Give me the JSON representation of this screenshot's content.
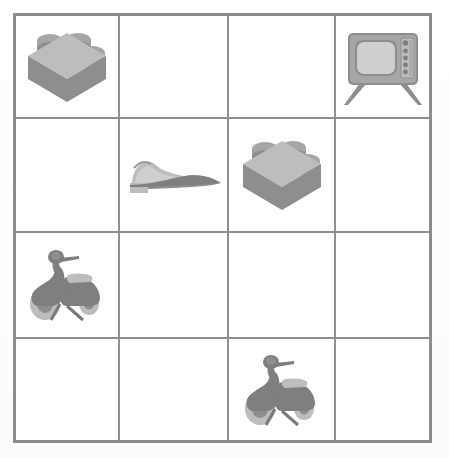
{
  "page": {
    "background_color": "#fefefe"
  },
  "grid": {
    "name": "object-grid",
    "rows": 4,
    "columns": 4,
    "border_color": "#8c8c8c",
    "line_color": "#8f8f8f",
    "cell_background": "#ffffff",
    "cells": [
      {
        "row": 1,
        "col": 1,
        "icon": "lego-brick-icon",
        "label": "Lego brick",
        "empty": false
      },
      {
        "row": 1,
        "col": 2,
        "icon": "",
        "label": "",
        "empty": true
      },
      {
        "row": 1,
        "col": 3,
        "icon": "",
        "label": "",
        "empty": true
      },
      {
        "row": 1,
        "col": 4,
        "icon": "television-icon",
        "label": "Television",
        "empty": false
      },
      {
        "row": 2,
        "col": 1,
        "icon": "",
        "label": "",
        "empty": true
      },
      {
        "row": 2,
        "col": 2,
        "icon": "dress-shoe-icon",
        "label": "Dress shoe",
        "empty": false
      },
      {
        "row": 2,
        "col": 3,
        "icon": "lego-brick-icon",
        "label": "Lego brick",
        "empty": false
      },
      {
        "row": 2,
        "col": 4,
        "icon": "",
        "label": "",
        "empty": true
      },
      {
        "row": 3,
        "col": 1,
        "icon": "scooter-icon",
        "label": "Scooter",
        "empty": false
      },
      {
        "row": 3,
        "col": 2,
        "icon": "",
        "label": "",
        "empty": true
      },
      {
        "row": 3,
        "col": 3,
        "icon": "",
        "label": "",
        "empty": true
      },
      {
        "row": 3,
        "col": 4,
        "icon": "",
        "label": "",
        "empty": true
      },
      {
        "row": 4,
        "col": 1,
        "icon": "",
        "label": "",
        "empty": true
      },
      {
        "row": 4,
        "col": 2,
        "icon": "",
        "label": "",
        "empty": true
      },
      {
        "row": 4,
        "col": 3,
        "icon": "scooter-icon",
        "label": "Scooter",
        "empty": false
      },
      {
        "row": 4,
        "col": 4,
        "icon": "",
        "label": "",
        "empty": true
      }
    ]
  },
  "icon_colors": {
    "dark": "#7f7f7f",
    "mid": "#8e8e8e",
    "light": "#a6a6a6",
    "pale": "#bdbdbd",
    "very_pale": "#cfcfcf"
  }
}
